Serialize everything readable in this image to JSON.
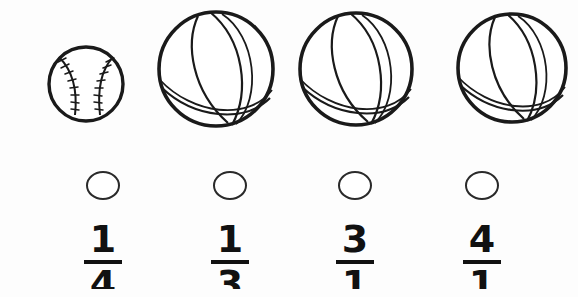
{
  "page": {
    "background_color": "#fdfdfd",
    "ink_color": "#1a1a1a"
  },
  "illustration": {
    "description": "row-of-balls",
    "balls": [
      {
        "name": "baseball",
        "icon": "baseball-icon",
        "size": "small",
        "center_x": 85,
        "center_y": 83,
        "radius": 37
      },
      {
        "name": "basketball-1",
        "icon": "basketball-icon",
        "size": "large",
        "center_x": 216,
        "center_y": 69,
        "radius": 59
      },
      {
        "name": "basketball-2",
        "icon": "basketball-icon",
        "size": "large",
        "center_x": 355,
        "center_y": 69,
        "radius": 58
      },
      {
        "name": "basketball-3",
        "icon": "basketball-icon",
        "size": "large",
        "center_x": 510,
        "center_y": 68,
        "radius": 56
      }
    ]
  },
  "answer_choices": [
    {
      "id": "choice-1",
      "bubble": "answer-bubble",
      "numerator": "1",
      "denominator": "4",
      "fraction_text": "1/4",
      "center_x": 103
    },
    {
      "id": "choice-2",
      "bubble": "answer-bubble",
      "numerator": "1",
      "denominator": "3",
      "fraction_text": "1/3",
      "center_x": 230
    },
    {
      "id": "choice-3",
      "bubble": "answer-bubble",
      "numerator": "3",
      "denominator": "1",
      "fraction_text": "3/1",
      "center_x": 355
    },
    {
      "id": "choice-4",
      "bubble": "answer-bubble",
      "numerator": "4",
      "denominator": "1",
      "fraction_text": "4/1",
      "center_x": 482
    }
  ]
}
